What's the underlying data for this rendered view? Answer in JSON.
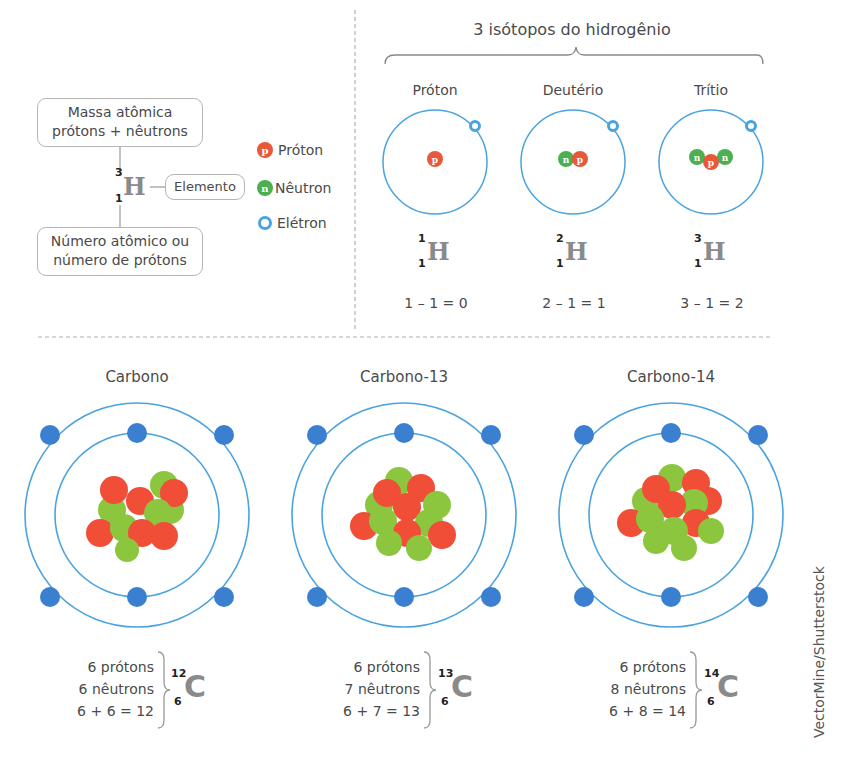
{
  "legend_panel": {
    "mass_box": [
      "Massa atômica",
      "prótons + nêutrons"
    ],
    "element_label": "Elemento",
    "atomic_box": [
      "Número atômico ou",
      "número de prótons"
    ],
    "example": {
      "symbol": "H",
      "mass_number": "3",
      "atomic_number": "1"
    },
    "legend": [
      {
        "glyph": "p",
        "label": "Próton",
        "color": "#e8583a"
      },
      {
        "glyph": "n",
        "label": "Nêutron",
        "color": "#4caf50"
      },
      {
        "glyph": "e",
        "label": "Elétron",
        "color": "#4aa3df"
      }
    ]
  },
  "hydrogen": {
    "title": "3 isótopos do hidrogênio",
    "isotopes": [
      {
        "name": "Próton",
        "mass_number": "1",
        "atomic_number": "1",
        "symbol": "H",
        "equation": "1 – 1 = 0",
        "nucleus": [
          "p"
        ]
      },
      {
        "name": "Deutério",
        "mass_number": "2",
        "atomic_number": "1",
        "symbol": "H",
        "equation": "2 – 1 = 1",
        "nucleus": [
          "n",
          "p"
        ]
      },
      {
        "name": "Trítio",
        "mass_number": "3",
        "atomic_number": "1",
        "symbol": "H",
        "equation": "3 – 1 = 2",
        "nucleus": [
          "n",
          "p",
          "n"
        ]
      }
    ]
  },
  "carbon": {
    "isotopes": [
      {
        "name": "Carbono",
        "protons": "6 prótons",
        "neutrons": "6 nêutrons",
        "sum": "6 + 6 = 12",
        "mass_number": "12",
        "atomic_number": "6",
        "symbol": "C"
      },
      {
        "name": "Carbono-13",
        "protons": "6 prótons",
        "neutrons": "7 nêutrons",
        "sum": "6 + 7 = 13",
        "mass_number": "13",
        "atomic_number": "6",
        "symbol": "C"
      },
      {
        "name": "Carbono-14",
        "protons": "6 prótons",
        "neutrons": "8 nêutrons",
        "sum": "6 + 8 = 14",
        "mass_number": "14",
        "atomic_number": "6",
        "symbol": "C"
      }
    ]
  },
  "credit": "VectorMine/Shutterstock",
  "colors": {
    "proton": "#e8583a",
    "neutron": "#8cc63f",
    "electron": "#3a7fd0",
    "orbit": "#4aa3df",
    "divider": "#b0b0b0"
  }
}
